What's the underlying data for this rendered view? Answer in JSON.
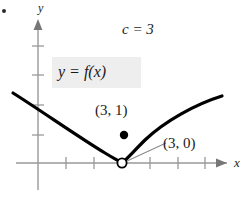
{
  "figure": {
    "background_color": "#ffffff",
    "axis_color": "#999999",
    "curve_color": "#000000",
    "text_color": "#1a1a1a",
    "highlight_color": "#eeeeee"
  },
  "axes": {
    "x_label": "x",
    "y_label": "y",
    "x_axis_y_px": 163,
    "y_axis_x_px": 38,
    "x_ticks_px": [
      66,
      94,
      150,
      178,
      205
    ],
    "y_ticks_px": [
      46,
      75,
      105,
      135
    ]
  },
  "annotations": {
    "c_value": "c = 3",
    "function_label": "y = f(x)",
    "point_filled_label": "(3, 1)",
    "point_open_label": "(3, 0)"
  },
  "points": {
    "filled": {
      "name": "point-3-1",
      "label": "(3, 1)",
      "x": 3,
      "y": 1,
      "px": 124,
      "py": 135,
      "style": "filled"
    },
    "open": {
      "name": "point-3-0",
      "label": "(3, 0)",
      "x": 3,
      "y": 0,
      "px": 122,
      "py": 163,
      "style": "open"
    }
  },
  "chart_data": {
    "type": "line",
    "title": "",
    "xlabel": "x",
    "ylabel": "y",
    "grid": false,
    "legend": "none",
    "series": [
      {
        "name": "f(x) left branch",
        "path": "M13,93 C40,110 80,138 105,153 C113,158 119,161 122,163"
      },
      {
        "name": "f(x) right branch",
        "path": "M122,163 C126,160 133,152 145,140 C165,121 196,104 222,96"
      }
    ],
    "discontinuity": {
      "at_x": 3,
      "limit_value": 0,
      "function_value": 1,
      "kind": "removable"
    }
  }
}
